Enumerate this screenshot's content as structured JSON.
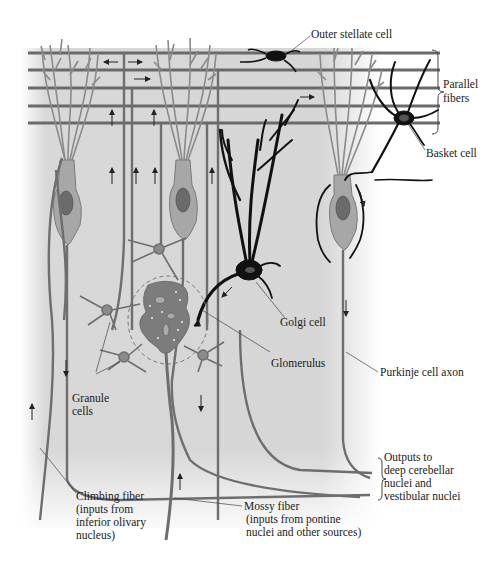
{
  "figure": {
    "colors": {
      "background_field": "#d6d6d6",
      "fiber": "#6e6e6e",
      "cell_body": "#a9a9a9",
      "nucleus": "#6b6b6b",
      "dark_cell": "#111111",
      "label_text": "#1a1a1a"
    }
  },
  "labels": {
    "outer_stellate": "Outer stellate cell",
    "parallel_fibers_1": "Parallel",
    "parallel_fibers_2": "fibers",
    "basket_cell": "Basket cell",
    "golgi_cell": "Golgi cell",
    "glomerulus": "Glomerulus",
    "purkinje_axon": "Purkinje cell axon",
    "granule_1": "Granule",
    "granule_2": "cells",
    "outputs_1": "Outputs to",
    "outputs_2": "deep cerebellar",
    "outputs_3": "nuclei and",
    "outputs_4": "vestibular nuclei",
    "climbing_1": "Climbing fiber",
    "climbing_2": "(inputs from",
    "climbing_3": "inferior olivary",
    "climbing_4": "nucleus)",
    "mossy_1": "Mossy fiber",
    "mossy_2": "(inputs from pontine",
    "mossy_3": "nuclei and other sources)"
  }
}
